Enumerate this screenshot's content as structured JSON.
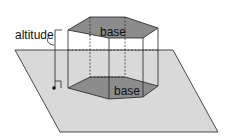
{
  "diagram": {
    "labels": {
      "altitude": "altitude",
      "top_base": "base",
      "bottom_base": "base"
    },
    "colors": {
      "plane": "#d9d9d9",
      "base_fill": "#8c8c8c",
      "edge": "#222222"
    }
  }
}
